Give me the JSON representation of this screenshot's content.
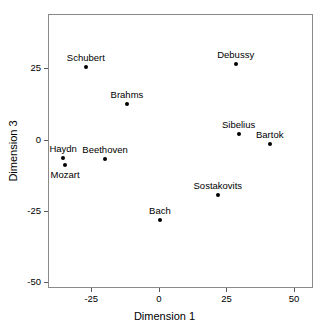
{
  "chart_data": {
    "type": "scatter",
    "title": "",
    "xlabel": "Dimension 1",
    "ylabel": "Dimension 3",
    "xlim": [
      -41,
      57
    ],
    "ylim": [
      -52,
      44
    ],
    "xticks": [
      -25,
      0,
      25,
      50
    ],
    "xtick_labels": [
      "-25",
      "0",
      "25",
      "50"
    ],
    "yticks": [
      25,
      0,
      -25,
      -50
    ],
    "ytick_labels": [
      "25",
      "0",
      "-25",
      "-50"
    ],
    "grid": false,
    "legend": "none",
    "marker_color": "#000000",
    "frame_color": "#8a8a8a",
    "points": [
      {
        "label": "Schubert",
        "x": -27.0,
        "y": 25.3,
        "label_pos": "above"
      },
      {
        "label": "Brahms",
        "x": -11.8,
        "y": 12.5,
        "label_pos": "above"
      },
      {
        "label": "Haydn",
        "x": -35.4,
        "y": -6.3,
        "label_pos": "above"
      },
      {
        "label": "Mozart",
        "x": -34.7,
        "y": -9.0,
        "label_pos": "below"
      },
      {
        "label": "Beethoven",
        "x": -19.9,
        "y": -6.9,
        "label_pos": "above"
      },
      {
        "label": "Bach",
        "x": 0.4,
        "y": -28.1,
        "label_pos": "above"
      },
      {
        "label": "Debussy",
        "x": 28.4,
        "y": 26.4,
        "label_pos": "above"
      },
      {
        "label": "Sibelius",
        "x": 29.5,
        "y": 2.1,
        "label_pos": "above"
      },
      {
        "label": "Bartok",
        "x": 41.0,
        "y": -1.4,
        "label_pos": "above"
      },
      {
        "label": "Sostakovits",
        "x": 21.8,
        "y": -19.4,
        "label_pos": "above"
      }
    ]
  }
}
